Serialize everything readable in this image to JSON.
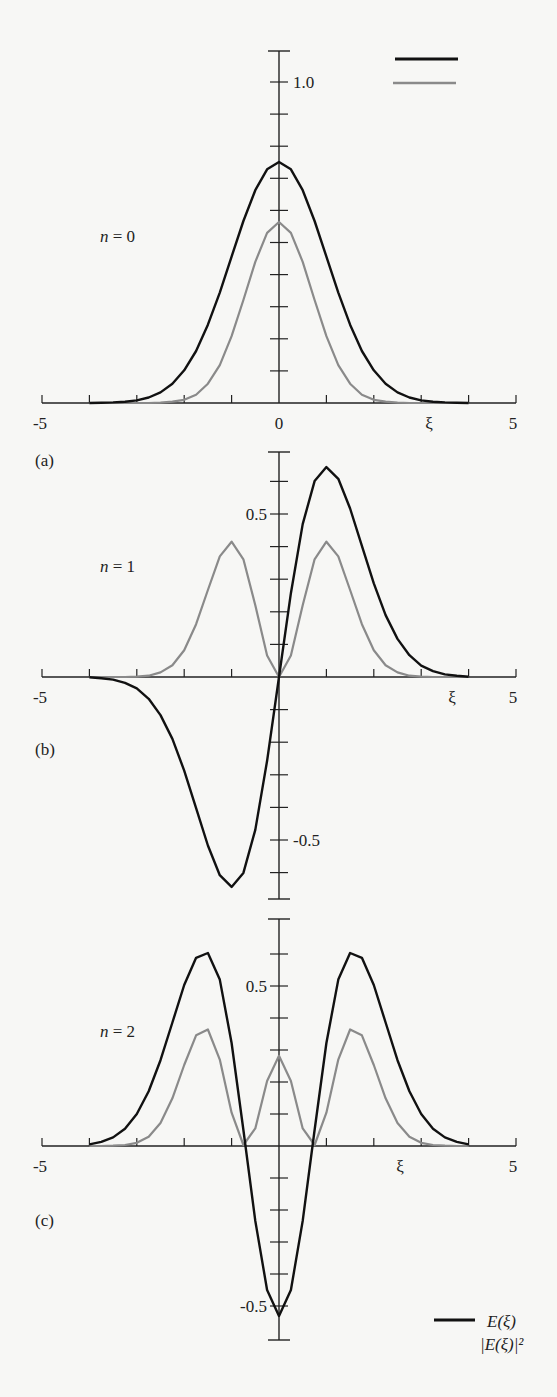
{
  "figure": {
    "legend": {
      "psi_label": "E(ξ)",
      "prob_label": "|E(ξ)|²",
      "psi_color": "#111111",
      "prob_color": "#8a8a8a"
    }
  },
  "chart_data": [
    {
      "type": "line",
      "panel": "(a)",
      "annotation": "n = 0",
      "xlabel": "ξ",
      "xlim": [
        -5,
        5
      ],
      "x_tick_labels": [
        "-5",
        "0",
        "5"
      ],
      "y_tick_labels": [
        "1.0"
      ],
      "ylim": [
        0,
        1.1
      ],
      "legend_position": "top-right",
      "x": [
        -4,
        -3.75,
        -3.5,
        -3.25,
        -3,
        -2.75,
        -2.5,
        -2.25,
        -2,
        -1.75,
        -1.5,
        -1.25,
        -1,
        -0.75,
        -0.5,
        -0.25,
        0,
        0.25,
        0.5,
        0.75,
        1,
        1.25,
        1.5,
        1.75,
        2,
        2.25,
        2.5,
        2.75,
        3,
        3.25,
        3.5,
        3.75,
        4
      ],
      "series": [
        {
          "name": "E(ξ)",
          "values": [
            0.0,
            0.001,
            0.002,
            0.004,
            0.008,
            0.017,
            0.033,
            0.06,
            0.102,
            0.162,
            0.244,
            0.344,
            0.456,
            0.567,
            0.663,
            0.728,
            0.751,
            0.728,
            0.663,
            0.567,
            0.456,
            0.344,
            0.244,
            0.162,
            0.102,
            0.06,
            0.033,
            0.017,
            0.008,
            0.004,
            0.002,
            0.001,
            0.0
          ]
        },
        {
          "name": "|E(ξ)|²",
          "values": [
            0.0,
            0.0,
            0.0,
            0.0,
            0.0,
            0.0,
            0.001,
            0.004,
            0.01,
            0.026,
            0.06,
            0.118,
            0.208,
            0.321,
            0.44,
            0.53,
            0.564,
            0.53,
            0.44,
            0.321,
            0.208,
            0.118,
            0.06,
            0.026,
            0.01,
            0.004,
            0.001,
            0.0,
            0.0,
            0.0,
            0.0,
            0.0,
            0.0
          ]
        }
      ]
    },
    {
      "type": "line",
      "panel": "(b)",
      "annotation": "n = 1",
      "xlabel": "ξ",
      "xlim": [
        -5,
        5
      ],
      "x_tick_labels": [
        "-5",
        "5"
      ],
      "y_tick_labels": [
        "0.5",
        "-0.5"
      ],
      "ylim": [
        -0.7,
        0.7
      ],
      "x": [
        -4,
        -3.75,
        -3.5,
        -3.25,
        -3,
        -2.75,
        -2.5,
        -2.25,
        -2,
        -1.75,
        -1.5,
        -1.25,
        -1,
        -0.75,
        -0.5,
        -0.25,
        0,
        0.25,
        0.5,
        0.75,
        1,
        1.25,
        1.5,
        1.75,
        2,
        2.25,
        2.5,
        2.75,
        3,
        3.25,
        3.5,
        3.75,
        4
      ],
      "series": [
        {
          "name": "E(ξ)",
          "values": [
            -0.001,
            -0.004,
            -0.008,
            -0.018,
            -0.035,
            -0.067,
            -0.117,
            -0.19,
            -0.287,
            -0.402,
            -0.517,
            -0.608,
            -0.644,
            -0.601,
            -0.469,
            -0.257,
            0.0,
            0.257,
            0.469,
            0.601,
            0.644,
            0.608,
            0.517,
            0.402,
            0.287,
            0.19,
            0.117,
            0.067,
            0.035,
            0.018,
            0.008,
            0.004,
            0.001
          ]
        },
        {
          "name": "|E(ξ)|²",
          "values": [
            0.0,
            0.0,
            0.0,
            0.0,
            0.001,
            0.004,
            0.014,
            0.036,
            0.082,
            0.162,
            0.267,
            0.37,
            0.415,
            0.361,
            0.22,
            0.066,
            0.0,
            0.066,
            0.22,
            0.361,
            0.415,
            0.37,
            0.267,
            0.162,
            0.082,
            0.036,
            0.014,
            0.004,
            0.001,
            0.0,
            0.0,
            0.0,
            0.0
          ]
        }
      ]
    },
    {
      "type": "line",
      "panel": "(c)",
      "annotation": "n = 2",
      "xlabel": "ξ",
      "xlim": [
        -5,
        5
      ],
      "x_tick_labels": [
        "-5",
        "5"
      ],
      "y_tick_labels": [
        "0.5",
        "-0.5"
      ],
      "ylim": [
        -0.6,
        0.7
      ],
      "legend_position": "bottom-right",
      "x": [
        -4,
        -3.75,
        -3.5,
        -3.25,
        -3,
        -2.75,
        -2.5,
        -2.25,
        -2,
        -1.75,
        -1.5,
        -1.25,
        -1,
        -0.75,
        -0.5,
        -0.25,
        0,
        0.25,
        0.5,
        0.75,
        1,
        1.25,
        1.5,
        1.75,
        2,
        2.25,
        2.5,
        2.75,
        3,
        3.25,
        3.5,
        3.75,
        4
      ],
      "series": [
        {
          "name": "E(ξ)",
          "values": [
            0.005,
            0.013,
            0.027,
            0.054,
            0.1,
            0.171,
            0.268,
            0.386,
            0.503,
            0.588,
            0.603,
            0.52,
            0.322,
            0.05,
            -0.234,
            -0.45,
            -0.531,
            -0.45,
            -0.234,
            0.05,
            0.322,
            0.52,
            0.603,
            0.588,
            0.503,
            0.386,
            0.268,
            0.171,
            0.1,
            0.054,
            0.027,
            0.013,
            0.005
          ]
        },
        {
          "name": "|E(ξ)|²",
          "values": [
            0.0,
            0.0,
            0.001,
            0.003,
            0.01,
            0.029,
            0.072,
            0.149,
            0.253,
            0.346,
            0.364,
            0.27,
            0.104,
            0.003,
            0.055,
            0.203,
            0.282,
            0.203,
            0.055,
            0.003,
            0.104,
            0.27,
            0.364,
            0.346,
            0.253,
            0.149,
            0.072,
            0.029,
            0.01,
            0.003,
            0.001,
            0.0,
            0.0
          ]
        }
      ]
    }
  ],
  "layout": {
    "x0": 42,
    "x1": 516,
    "panels": [
      {
        "baseline": 403,
        "yscale": 321,
        "ytop": 51,
        "ybottom": 403,
        "tick_top": 1.0,
        "tick_bottom": 0.0,
        "xi_label_x": 429,
        "label_y": 242,
        "ann_x": 100,
        "panel_label_y": 466,
        "yt_label": [
          {
            "text_key": 0,
            "v": 1.0,
            "side": "right"
          }
        ]
      },
      {
        "baseline": 677,
        "yscale": 326,
        "ytop": 452,
        "ybottom": 899,
        "tick_top": 0.6,
        "tick_bottom": -0.6,
        "xi_label_x": 452,
        "label_y": 572,
        "ann_x": 100,
        "panel_label_y": 755,
        "yt_label": [
          {
            "text_key": 0,
            "v": 0.5,
            "side": "left"
          },
          {
            "text_key": 1,
            "v": -0.5,
            "side": "right"
          }
        ]
      },
      {
        "baseline": 1146,
        "yscale": 320,
        "ytop": 919,
        "ybottom": 1340,
        "tick_top": 0.6,
        "tick_bottom": -0.6,
        "xi_label_x": 400,
        "label_y": 1037,
        "ann_x": 100,
        "panel_label_y": 1226,
        "yt_label": [
          {
            "text_key": 0,
            "v": 0.5,
            "side": "left"
          },
          {
            "text_key": 1,
            "v": -0.5,
            "side": "left"
          }
        ]
      }
    ]
  }
}
